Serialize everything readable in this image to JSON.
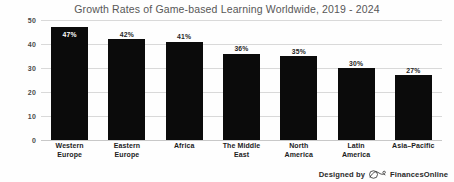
{
  "chart_data": {
    "type": "bar",
    "title": "Growth Rates of Game-based Learning Worldwide, 2019 - 2024",
    "xlabel": "",
    "ylabel": "",
    "ylim": [
      0,
      50
    ],
    "yticks": [
      0,
      10,
      20,
      30,
      40,
      50
    ],
    "ytick_labels": [
      "0",
      "10",
      "20",
      "30",
      "40",
      "50"
    ],
    "grid": true,
    "legend": "none",
    "bar_color": "#0b0b0b",
    "categories": [
      "Western Europe",
      "Eastern Europe",
      "Africa",
      "The Middle East",
      "North America",
      "Latin America",
      "Asia–Pacific"
    ],
    "category_lines": [
      [
        "Western",
        "Europe"
      ],
      [
        "Eastern",
        "Europe"
      ],
      [
        "Africa",
        ""
      ],
      [
        "The Middle",
        "East"
      ],
      [
        "North",
        "America"
      ],
      [
        "Latin",
        "America"
      ],
      [
        "Asia–Pacific",
        ""
      ]
    ],
    "values": [
      47,
      42,
      41,
      36,
      35,
      30,
      27
    ],
    "data_labels": [
      "47%",
      "42%",
      "41%",
      "36%",
      "35%",
      "30%",
      "27%"
    ],
    "label_placement": [
      "inside",
      "above",
      "above",
      "above",
      "above",
      "above",
      "above"
    ]
  },
  "footer": {
    "designed_by": "Designed by",
    "brand": "FinancesOnline",
    "logo_icon": "financesonline-infinity-logo-icon"
  }
}
